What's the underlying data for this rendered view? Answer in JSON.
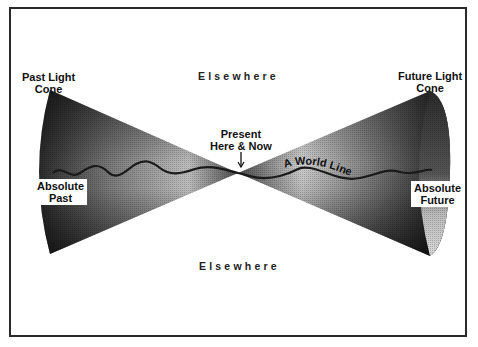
{
  "diagram": {
    "labels": {
      "past_light_cone": [
        "Past Light",
        "Cone"
      ],
      "future_light_cone": [
        "Future Light",
        "Cone"
      ],
      "elsewhere_top": "Elsewhere",
      "elsewhere_bottom": "Elsewhere",
      "present": [
        "Present",
        "Here & Now"
      ],
      "absolute_past": [
        "Absolute",
        "Past"
      ],
      "absolute_future": [
        "Absolute",
        "Future"
      ],
      "world_line": "A World Line"
    },
    "colors": {
      "frame": "#2a2a2a",
      "cone_dark": "#1a1a1a",
      "cone_light": "#e6e6e6",
      "text": "#111111",
      "background": "#ffffff"
    },
    "geometry": {
      "apex": [
        238,
        173
      ],
      "past_cone_rim_top": [
        50,
        90
      ],
      "past_cone_rim_bottom": [
        50,
        254
      ],
      "future_cone_rim_top": [
        430,
        91
      ],
      "future_cone_rim_bottom": [
        430,
        256
      ]
    }
  }
}
